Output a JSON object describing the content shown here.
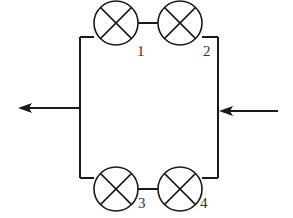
{
  "diagram": {
    "type": "parallel circuit",
    "branches": [
      {
        "position": "top",
        "lamps": [
          {
            "id": "1",
            "label": "1"
          },
          {
            "id": "2",
            "label": "2"
          }
        ]
      },
      {
        "position": "bottom",
        "lamps": [
          {
            "id": "3",
            "label": "3"
          },
          {
            "id": "4",
            "label": "4"
          }
        ]
      }
    ],
    "current_in": {
      "side": "right",
      "direction": "left"
    },
    "current_out": {
      "side": "left",
      "direction": "left"
    },
    "colors": {
      "line": "#1a1a1a",
      "background": "#ffffff"
    }
  },
  "labels": {
    "lamp1": "1",
    "lamp2": "2",
    "lamp3": "3",
    "lamp4": "4"
  }
}
